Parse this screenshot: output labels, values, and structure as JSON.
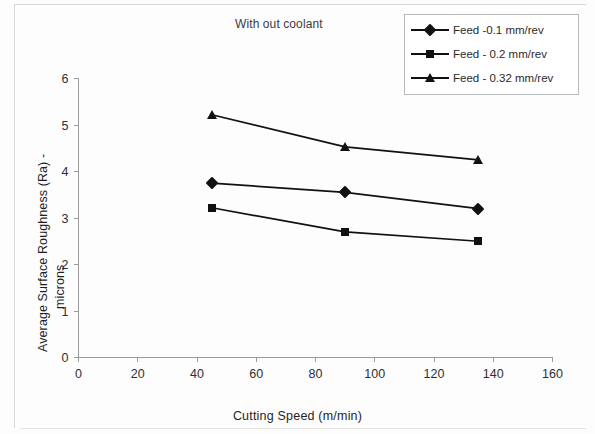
{
  "chart_data": {
    "type": "line",
    "title": "With out coolant",
    "xlabel": "Cutting Speed (m/min)",
    "ylabel": "Average Surface Roughness (Ra) - microns",
    "ylabel_line_1": "Average Surface Roughness (Ra) -",
    "ylabel_line_2": "microns",
    "x": [
      45,
      90,
      135
    ],
    "xlim": [
      0,
      160
    ],
    "ylim": [
      0,
      6
    ],
    "xticks": [
      0,
      20,
      40,
      60,
      80,
      100,
      120,
      140,
      160
    ],
    "yticks": [
      0,
      1,
      2,
      3,
      4,
      5,
      6
    ],
    "xtick_labels": [
      "0",
      "20",
      "40",
      "60",
      "80",
      "100",
      "120",
      "140",
      "160"
    ],
    "ytick_labels": [
      "0",
      "1",
      "2",
      "3",
      "4",
      "5",
      "6"
    ],
    "grid": false,
    "legend_position": "top-right",
    "series": [
      {
        "name": "Feed -0.1 mm/rev",
        "marker": "diamond",
        "color": "#111111",
        "values": [
          3.75,
          3.55,
          3.2
        ]
      },
      {
        "name": "Feed - 0.2 mm/rev",
        "marker": "square",
        "color": "#111111",
        "values": [
          3.22,
          2.7,
          2.5
        ]
      },
      {
        "name": "Feed - 0.32 mm/rev",
        "marker": "triangle",
        "color": "#111111",
        "values": [
          5.22,
          4.53,
          4.25
        ]
      }
    ]
  },
  "legend": {
    "items": [
      {
        "label": "Feed -0.1 mm/rev",
        "marker": "diamond-marker-icon"
      },
      {
        "label": "Feed - 0.2 mm/rev",
        "marker": "square-marker-icon"
      },
      {
        "label": "Feed - 0.32 mm/rev",
        "marker": "triangle-marker-icon"
      }
    ]
  }
}
